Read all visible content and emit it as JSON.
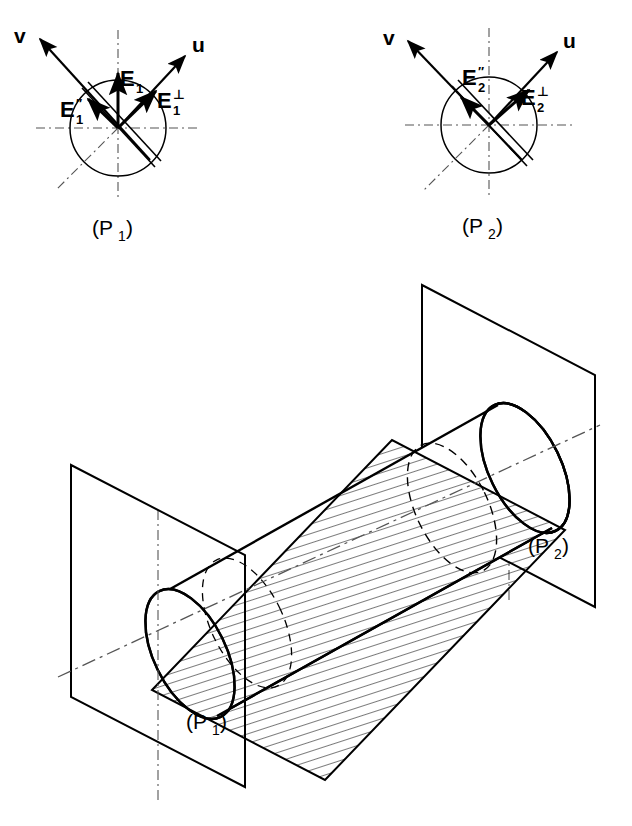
{
  "figure": {
    "stroke_color": "#000000",
    "thin_color": "#1a1a1a",
    "background": "#ffffff"
  },
  "panels": [
    {
      "id": "p1",
      "caption": "(P",
      "caption_sub": "1",
      "caption_close": ")",
      "center": {
        "x": 118,
        "y": 128
      },
      "radius": 48,
      "vectors": [
        {
          "name": "v",
          "label": "v",
          "tip": {
            "x": 36,
            "y": 36
          },
          "angle_deg": 135
        },
        {
          "name": "u",
          "label": "u",
          "tip": {
            "x": 188,
            "y": 54
          },
          "angle_deg": 40
        },
        {
          "name": "E1",
          "label": "E",
          "sub": "1",
          "sup": "",
          "tip": {
            "x": 118,
            "y": 72
          },
          "angle_deg": 90
        },
        {
          "name": "E1-perp",
          "label": "E",
          "sub": "1",
          "sup": "⊥",
          "tip": {
            "x": 158,
            "y": 90
          },
          "angle_deg": 40
        },
        {
          "name": "E1-dprime",
          "label": "E",
          "sub": "1",
          "sup": "′′",
          "tip": {
            "x": 86,
            "y": 97
          },
          "angle_deg": 135
        }
      ],
      "band_angle_deg": 135,
      "has_vertical_E": true
    },
    {
      "id": "p2",
      "caption": "(P",
      "caption_sub": "2",
      "caption_close": ")",
      "center": {
        "x": 489,
        "y": 125
      },
      "radius": 48,
      "vectors": [
        {
          "name": "v",
          "label": "v",
          "tip": {
            "x": 404,
            "y": 38
          },
          "angle_deg": 135
        },
        {
          "name": "u",
          "label": "u",
          "tip": {
            "x": 560,
            "y": 50
          },
          "angle_deg": 40
        },
        {
          "name": "E2-perp",
          "label": "E",
          "sub": "2",
          "sup": "⊥",
          "tip": {
            "x": 520,
            "y": 95
          },
          "angle_deg": 45
        },
        {
          "name": "E2-dprime",
          "label": "E",
          "sub": "2",
          "sup": "′′",
          "tip": {
            "x": 465,
            "y": 98
          },
          "angle_deg": 128
        }
      ],
      "band_angle_deg": 135,
      "has_vertical_E": false
    }
  ],
  "scene": {
    "caption_p1": "(P",
    "caption_p1_sub": "1",
    "caption_p1_close": ")",
    "caption_p2": "(P",
    "caption_p2_sub": "2",
    "caption_p2_close": ")",
    "plane1": {
      "name": "plane-P1",
      "corners": [
        [
          71,
          465
        ],
        [
          245,
          555
        ],
        [
          245,
          787
        ],
        [
          71,
          697
        ]
      ]
    },
    "plane2": {
      "name": "plane-P2",
      "corners": [
        [
          422,
          285
        ],
        [
          595,
          375
        ],
        [
          595,
          607
        ],
        [
          422,
          517
        ]
      ]
    },
    "cylinder": {
      "axis_start": {
        "x": 90,
        "y": 655
      },
      "axis_end": {
        "x": 560,
        "y": 420
      },
      "cap_rx": 36,
      "cap_ry": 68,
      "tilt_deg": -20
    },
    "cut_plane": {
      "name": "oblique-cutting-plane",
      "hatch_angle_deg": 75,
      "corners": [
        [
          152,
          690
        ],
        [
          392,
          440
        ],
        [
          565,
          530
        ],
        [
          325,
          780
        ]
      ]
    }
  }
}
